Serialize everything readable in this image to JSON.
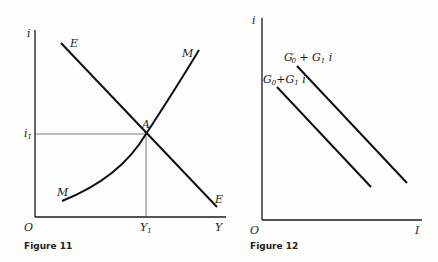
{
  "figure11": {
    "caption": "Figure 11",
    "y_axis_label": "i",
    "x_axis_label": "Y",
    "origin_label": "O",
    "y_tick_label": "i",
    "y_tick_sub": "1",
    "x_tick_label": "Y",
    "x_tick_sub": "1",
    "curve_E_label": "E",
    "curve_M_label": "M",
    "intersection_label": "A"
  },
  "figure12": {
    "caption": "Figure 12",
    "y_axis_label": "i",
    "x_axis_label": "I",
    "origin_label": "O",
    "line1_label": {
      "g": "G",
      "sub0": "0",
      "plus": "+G",
      "sub1": "1",
      "var": " i"
    },
    "line2_label": {
      "g": "G",
      "prime": "′",
      "sub0": "0",
      "plus": " + G",
      "sub1": "1",
      "var": " i"
    }
  },
  "colors": {
    "ink": "#1a1a1a",
    "background": "#fdfdfd"
  }
}
